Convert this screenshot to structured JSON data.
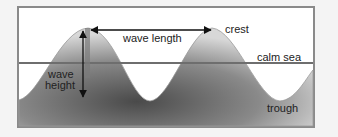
{
  "diagram": {
    "labels": {
      "wave_length": "wave length",
      "crest": "crest",
      "calm_sea": "calm sea",
      "wave_height_line1": "wave",
      "wave_height_line2": "height",
      "trough": "trough"
    },
    "colors": {
      "background": "#f4f4f4",
      "frame": "#8a8a8a",
      "water_dark": "#4a4a4a",
      "water_light": "#d8d8d8",
      "calm_line": "#6e6e6e",
      "arrow": "#111111"
    }
  }
}
